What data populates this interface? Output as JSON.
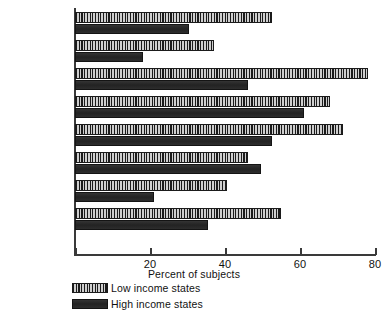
{
  "chart_data": {
    "type": "bar",
    "orientation": "horizontal",
    "title": "",
    "xlabel": "Percent of subjects",
    "ylabel": "",
    "xlim": [
      0,
      80
    ],
    "xticks": [
      0,
      20,
      40,
      60,
      80
    ],
    "xtick_labels": [
      "",
      "20",
      "40",
      "60",
      "80"
    ],
    "grid": false,
    "legend_position": "bottom-left",
    "categories": [
      "Calories",
      "Protein",
      "Calcium",
      "Iron",
      "Vitamin A",
      "Thiamin",
      "Riboflavin",
      "Ascorbic acid"
    ],
    "series": [
      {
        "name": "Low income states",
        "pattern": "vertical-stripes",
        "values": [
          52.5,
          37,
          78,
          68,
          71.5,
          46,
          40.5,
          55
        ]
      },
      {
        "name": "High income states",
        "pattern": "solid-dark",
        "values": [
          30.5,
          18,
          46,
          61,
          52.5,
          49.5,
          21,
          35.5
        ]
      }
    ]
  },
  "legend": {
    "items": [
      {
        "label": "Low income states",
        "swatch": "low"
      },
      {
        "label": "High income states",
        "swatch": "high"
      }
    ]
  },
  "colors": {
    "axis": "#3a3a3a",
    "low_income_dark": "#1b1b1b",
    "low_income_light": "#cfcfcf",
    "high_income": "#2a2a2a",
    "background": "#ffffff"
  }
}
